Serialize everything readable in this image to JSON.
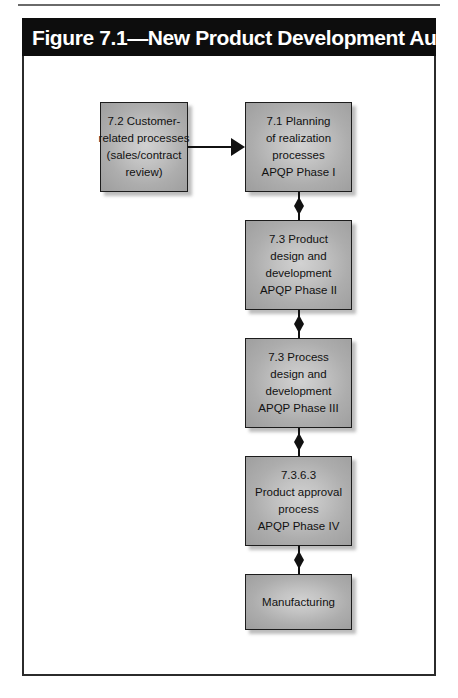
{
  "figure": {
    "title": "Figure 7.1—New Product Development Audit Trail"
  },
  "colors": {
    "title_bar_bg": "#0d0d0d",
    "title_text": "#ffffff",
    "frame_border": "#2b2b2b",
    "node_fill": "#bdbdbd",
    "node_border": "#1c1c1c",
    "connector": "#111111",
    "page_bg": "#ffffff"
  },
  "diagram": {
    "type": "flowchart",
    "nodes": [
      {
        "id": "customer-related-processes",
        "lines": [
          "7.2 Customer-",
          "related processes",
          "(sales/contract",
          "review)"
        ],
        "x": 78,
        "y": 46,
        "w": 88,
        "h": 90
      },
      {
        "id": "planning-of-realization-processes",
        "lines": [
          "7.1 Planning",
          "of realization",
          "processes",
          "APQP Phase I"
        ],
        "x": 223,
        "y": 46,
        "w": 107,
        "h": 90
      },
      {
        "id": "product-design-and-development",
        "lines": [
          "7.3 Product",
          "design and",
          "development",
          "APQP Phase II"
        ],
        "x": 223,
        "y": 164,
        "w": 107,
        "h": 90
      },
      {
        "id": "process-design-and-development",
        "lines": [
          "7.3 Process",
          "design and",
          "development",
          "APQP Phase III"
        ],
        "x": 223,
        "y": 282,
        "w": 107,
        "h": 90
      },
      {
        "id": "product-approval-process",
        "lines": [
          "7.3.6.3",
          "Product approval",
          "process",
          "APQP Phase IV"
        ],
        "x": 223,
        "y": 400,
        "w": 107,
        "h": 90
      },
      {
        "id": "manufacturing",
        "lines": [
          "Manufacturing"
        ],
        "x": 223,
        "y": 518,
        "w": 107,
        "h": 56
      }
    ],
    "connectors": [
      {
        "id": "customer-to-planning",
        "kind": "horizontal-single-arrow",
        "from": "customer-related-processes",
        "to": "planning-of-realization-processes",
        "direction": "right"
      },
      {
        "id": "planning-to-product-design",
        "kind": "vertical-double-arrow",
        "from": "planning-of-realization-processes",
        "to": "product-design-and-development",
        "direction": "both"
      },
      {
        "id": "product-design-to-process-design",
        "kind": "vertical-double-arrow",
        "from": "product-design-and-development",
        "to": "process-design-and-development",
        "direction": "both"
      },
      {
        "id": "process-design-to-product-approval",
        "kind": "vertical-double-arrow",
        "from": "process-design-and-development",
        "to": "product-approval-process",
        "direction": "both"
      },
      {
        "id": "product-approval-to-manufacturing",
        "kind": "vertical-double-arrow",
        "from": "product-approval-process",
        "to": "manufacturing",
        "direction": "both"
      }
    ]
  }
}
